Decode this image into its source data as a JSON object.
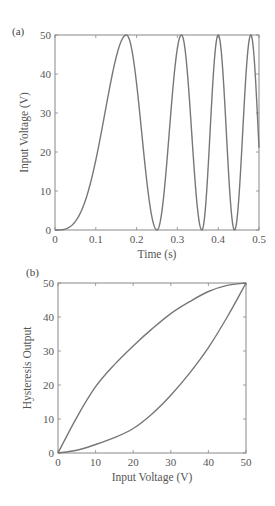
{
  "colors": {
    "line": "#777777",
    "axes": "#888888",
    "text": "#555555"
  },
  "chart_data": [
    {
      "panel": "(a)",
      "type": "line",
      "title": "",
      "xlabel": "Time (s)",
      "ylabel": "Input Voltage (V)",
      "xlim": [
        0,
        0.5
      ],
      "ylim": [
        0,
        50
      ],
      "xticks": [
        0,
        0.1,
        0.2,
        0.3,
        0.4,
        0.5
      ],
      "xtick_labels": [
        "0",
        "0.1",
        "0.2",
        "0.3",
        "0.4",
        "0.5"
      ],
      "yticks": [
        0,
        10,
        20,
        30,
        40,
        50
      ],
      "ytick_labels": [
        "0",
        "10",
        "20",
        "30",
        "40",
        "50"
      ],
      "grid": false,
      "description": "Chirp-like raised-cosine input voltage oscillating between 0 and 50 V with increasing frequency",
      "peaks_t": [
        0.175,
        0.31,
        0.4,
        0.48
      ],
      "troughs_t": [
        0.0,
        0.25,
        0.36,
        0.44
      ],
      "series": [
        {
          "name": "Input Voltage",
          "x": [
            0,
            0.03,
            0.05,
            0.075,
            0.1,
            0.125,
            0.15,
            0.175,
            0.2,
            0.225,
            0.25,
            0.28,
            0.31,
            0.335,
            0.36,
            0.38,
            0.4,
            0.42,
            0.44,
            0.46,
            0.48,
            0.49,
            0.5
          ],
          "values": [
            0,
            0.2,
            2,
            8,
            18,
            31,
            43,
            50,
            44,
            25,
            0,
            25,
            50,
            25,
            0,
            25,
            50,
            25,
            0,
            25,
            50,
            43,
            20
          ]
        }
      ]
    },
    {
      "panel": "(b)",
      "type": "line",
      "title": "",
      "xlabel": "Input Voltage (V)",
      "ylabel": "Hysteresis Output",
      "xlim": [
        0,
        50
      ],
      "ylim": [
        0,
        50
      ],
      "xticks": [
        0,
        10,
        20,
        30,
        40,
        50
      ],
      "xtick_labels": [
        "0",
        "10",
        "20",
        "30",
        "40",
        "50"
      ],
      "yticks": [
        0,
        10,
        20,
        30,
        40,
        50
      ],
      "ytick_labels": [
        "0",
        "10",
        "20",
        "30",
        "40",
        "50"
      ],
      "grid": false,
      "description": "Hysteresis loop between 0 and 50",
      "series": [
        {
          "name": "Ascending branch (upper)",
          "x": [
            0,
            5,
            10,
            15,
            20,
            25,
            30,
            35,
            40,
            45,
            50
          ],
          "values": [
            0,
            10.5,
            19.5,
            26,
            31.5,
            36.5,
            41,
            44.5,
            47.5,
            49.3,
            50
          ]
        },
        {
          "name": "Descending branch (lower)",
          "x": [
            0,
            5,
            10,
            15,
            20,
            25,
            30,
            35,
            40,
            45,
            50
          ],
          "values": [
            0,
            0.8,
            2.5,
            4.5,
            7.2,
            11.5,
            17,
            23.5,
            31,
            40,
            50
          ]
        }
      ]
    }
  ]
}
